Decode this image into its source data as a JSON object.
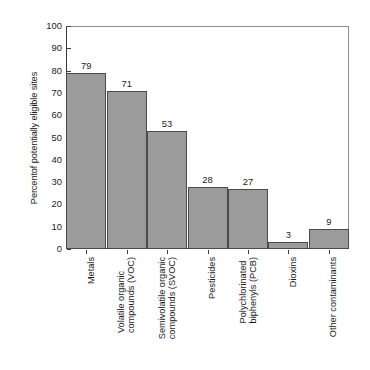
{
  "chart_data": {
    "type": "bar",
    "title": "",
    "subtitle": "",
    "xlabel": "",
    "ylabel": "Percentof potentially eligible sites",
    "ylim": [
      0,
      100
    ],
    "yticks": [
      0,
      10,
      20,
      30,
      40,
      50,
      60,
      70,
      80,
      90,
      100
    ],
    "grid": false,
    "legend": "none",
    "bar_color": "#9b9b9b",
    "bar_edge_color": "#4a4a4a",
    "axis_color": "#3a3a3a",
    "categories": [
      "Metals",
      "Volatile organic compounds (VOC)",
      "Semivolatile organic compounds (SVOC)",
      "Pesticides",
      "Polychlorinated biphenyls (PCB)",
      "Dioxins",
      "Other contaminants"
    ],
    "category_lines": [
      [
        "Metals"
      ],
      [
        "Volatile organic",
        "compounds (VOC)"
      ],
      [
        "Semivolatile organic",
        "compounds (SVOC)"
      ],
      [
        "Pesticides"
      ],
      [
        "Polychlorinated",
        "biphenyls (PCB)"
      ],
      [
        "Dioxins"
      ],
      [
        "Other contaminants"
      ]
    ],
    "values": [
      79,
      71,
      53,
      28,
      27,
      3,
      9
    ],
    "value_labels": [
      "79",
      "71",
      "53",
      "28",
      "27",
      "3",
      "9"
    ]
  }
}
